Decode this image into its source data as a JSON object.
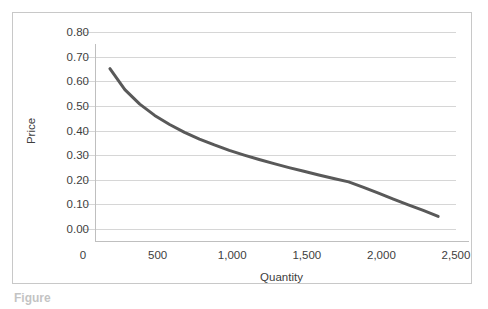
{
  "figure": {
    "caption": "Figure",
    "background_color": "#ffffff",
    "frame_color": "#c8c8c8"
  },
  "chart_data": {
    "type": "line",
    "title": "",
    "xlabel": "Quantity",
    "ylabel": "Price",
    "xlim": [
      0,
      2500
    ],
    "ylim": [
      0.0,
      0.8
    ],
    "grid": true,
    "legend": "none",
    "line_color": "#595959",
    "line_width": 3,
    "x_ticks": [
      "0",
      "500",
      "1,000",
      "1,500",
      "2,000",
      "2,500"
    ],
    "x_tick_values": [
      0,
      500,
      1000,
      1500,
      2000,
      2500
    ],
    "y_ticks": [
      "0.00",
      "0.10",
      "0.20",
      "0.30",
      "0.40",
      "0.50",
      "0.60",
      "0.70",
      "0.80"
    ],
    "y_tick_values": [
      0.0,
      0.1,
      0.2,
      0.3,
      0.4,
      0.5,
      0.6,
      0.7,
      0.8
    ],
    "series": [
      {
        "name": "Demand",
        "x": [
          100,
          200,
          300,
          400,
          500,
          600,
          700,
          800,
          900,
          1000,
          1100,
          1200,
          1300,
          1400,
          1500,
          1600,
          1700,
          1800,
          1900,
          2000,
          2100,
          2200,
          2300
        ],
        "y": [
          0.7,
          0.615,
          0.556,
          0.51,
          0.473,
          0.441,
          0.414,
          0.39,
          0.368,
          0.349,
          0.331,
          0.314,
          0.298,
          0.283,
          0.268,
          0.254,
          0.24,
          0.218,
          0.194,
          0.17,
          0.147,
          0.124,
          0.1
        ]
      }
    ]
  }
}
